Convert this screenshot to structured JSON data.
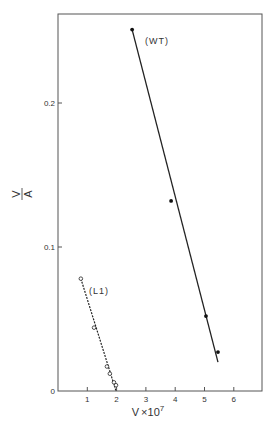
{
  "chart_data": {
    "type": "scatter",
    "title": "",
    "xlabel": "V x 10^7",
    "xlabel_main": "V",
    "xlabel_times": "×10",
    "xlabel_exp": "7",
    "ylabel": "V/A",
    "ylabel_num": "V",
    "ylabel_den": "A",
    "xlim": [
      0,
      6.9
    ],
    "ylim": [
      0,
      0.27
    ],
    "grid": false,
    "x_ticks": [
      1,
      2,
      3,
      4,
      5,
      6
    ],
    "x_tick_labels": [
      "1",
      "2",
      "3",
      "4",
      "5",
      "6"
    ],
    "y_ticks": [
      0,
      0.1,
      0.2
    ],
    "y_tick_labels": [
      "0",
      "0.1",
      "0.2"
    ],
    "series": [
      {
        "name": "(WT)",
        "marker": "filled-circle",
        "line": "solid",
        "points": [
          [
            2.53,
            0.251
          ],
          [
            3.86,
            0.132
          ],
          [
            5.05,
            0.052
          ],
          [
            5.46,
            0.027
          ]
        ],
        "fit_line": [
          [
            2.53,
            0.251
          ],
          [
            5.46,
            0.02
          ]
        ]
      },
      {
        "name": "(L1)",
        "marker": "open-circle",
        "line": "dashed",
        "points": [
          [
            0.78,
            0.078
          ],
          [
            1.23,
            0.044
          ],
          [
            1.67,
            0.017
          ],
          [
            1.77,
            0.012
          ],
          [
            1.91,
            0.006
          ],
          [
            1.98,
            0.004
          ]
        ],
        "fit_line": [
          [
            0.78,
            0.078
          ],
          [
            1.98,
            0.0
          ]
        ]
      }
    ]
  }
}
